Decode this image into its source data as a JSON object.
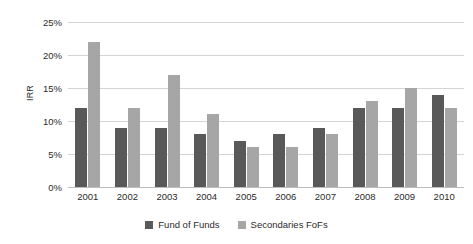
{
  "chart_data": {
    "type": "bar",
    "title": "",
    "subtitle": "",
    "xlabel": "",
    "ylabel": "IRR",
    "categories": [
      "2001",
      "2002",
      "2003",
      "2004",
      "2005",
      "2006",
      "2007",
      "2008",
      "2009",
      "2010"
    ],
    "series": [
      {
        "name": "Fund of Funds",
        "color": "#595959",
        "values": [
          12,
          9,
          9,
          8,
          7,
          8,
          9,
          12,
          12,
          14
        ]
      },
      {
        "name": "Secondaries FoFs",
        "color": "#a6a6a6",
        "values": [
          22,
          12,
          17,
          11,
          6,
          6,
          8,
          13,
          15,
          12
        ]
      }
    ],
    "ylim": [
      0,
      25
    ],
    "ytick_step": 5,
    "ytick_labels": [
      "0%",
      "5%",
      "10%",
      "15%",
      "20%",
      "25%"
    ],
    "ytick_values": [
      0,
      5,
      10,
      15,
      20,
      25
    ],
    "value_suffix": "%",
    "grid": true,
    "legend_position": "bottom"
  },
  "legend": {
    "items": [
      {
        "label": "Fund of Funds",
        "color": "#595959"
      },
      {
        "label": "Secondaries FoFs",
        "color": "#a6a6a6"
      }
    ]
  },
  "axis": {
    "y_title": "IRR"
  }
}
